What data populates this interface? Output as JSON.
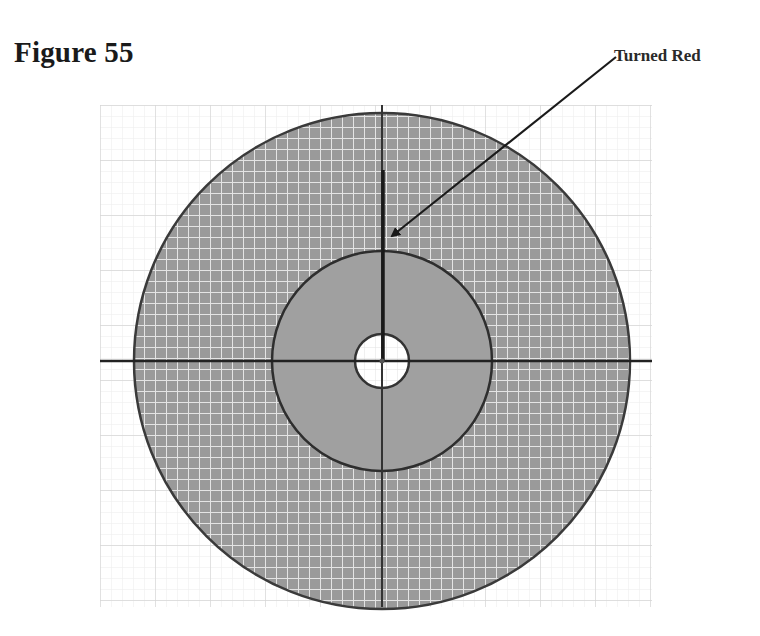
{
  "figure": {
    "title": "Figure 55",
    "annotation": {
      "label": "Turned Red",
      "arrow_from": [
        616,
        57
      ],
      "arrow_to": [
        390,
        238
      ]
    },
    "grid": {
      "x_min": 100,
      "x_max": 652,
      "y_min": 105,
      "y_max": 607,
      "minor_step": 11,
      "major_step": 55,
      "minor_color": "#ededed",
      "major_color": "#d9d9d9"
    },
    "center": [
      382,
      361
    ],
    "outer_disc": {
      "radius": 248,
      "fill": "#9a9a9a",
      "grid_color": "#e6e6e6",
      "stroke": "#3a3a3a"
    },
    "inner_ring": {
      "radius": 110,
      "fill": "#9f9f9f",
      "stroke": "#2e2e2e"
    },
    "center_hole": {
      "radius": 27,
      "fill": "#ffffff",
      "stroke": "#333333"
    },
    "axes": {
      "color": "#222222",
      "width": 2.5
    },
    "highlight_line": {
      "from_y": 170,
      "to_y": 361,
      "color": "#1a1a1a",
      "width": 3.5
    }
  }
}
